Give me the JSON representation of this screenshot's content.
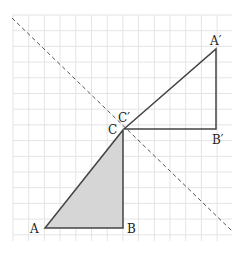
{
  "diagram": {
    "type": "geometric-transformation",
    "grid": {
      "x0": 13,
      "y0": 15,
      "x1": 232,
      "y1": 241,
      "cell": 15.7,
      "color": "#e4e4e4"
    },
    "mirror_line": {
      "x1": 12,
      "y1": 18,
      "x2": 232,
      "y2": 231,
      "color": "#555555",
      "dash": "4,3"
    },
    "triangle_original": {
      "fill": "#d6d6d6",
      "stroke": "#444444",
      "points": {
        "A": [
          45,
          228
        ],
        "B": [
          123,
          228
        ],
        "C": [
          123,
          130
        ]
      }
    },
    "triangle_image": {
      "stroke": "#444444",
      "points": {
        "A'": [
          216,
          49
        ],
        "B'": [
          216,
          129
        ],
        "C'": [
          124,
          129
        ]
      }
    },
    "labels": {
      "A": {
        "text": "A",
        "x": 30,
        "y": 233
      },
      "B": {
        "text": "B",
        "x": 127,
        "y": 233
      },
      "C": {
        "text": "C",
        "x": 108,
        "y": 134
      },
      "C_prime": {
        "text": "C′",
        "x": 118,
        "y": 122
      },
      "B_prime": {
        "text": "B′",
        "x": 212,
        "y": 144
      },
      "A_prime": {
        "text": "A′",
        "x": 210,
        "y": 45
      }
    }
  }
}
